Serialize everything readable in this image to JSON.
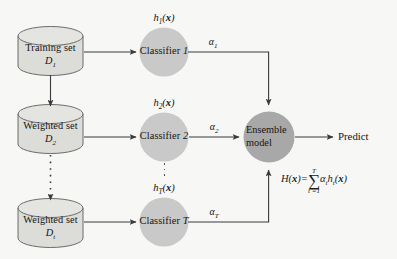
{
  "diagram": {
    "background_color": "#f7f7f6",
    "cylinder_fill": "#dcdcd8",
    "cylinder_stroke": "#5c5c5c",
    "classifier_fill": "#c9c9c9",
    "ensemble_fill": "#a8a8a8",
    "line_color": "#3a3a3a"
  },
  "datasets": [
    {
      "name": "training-set",
      "label": "Training set",
      "symbol_base": "D",
      "symbol_sub": "1"
    },
    {
      "name": "weighted-set-2",
      "label": "Weighted set",
      "symbol_base": "D",
      "symbol_sub": "2"
    },
    {
      "name": "weighted-set-t",
      "label": "Weighted set",
      "symbol_base": "D",
      "symbol_sub": "t"
    }
  ],
  "classifiers": [
    {
      "name": "classifier-1",
      "label": "Classifier",
      "index": "1",
      "h_base": "h",
      "h_sub": "1",
      "h_arg": "(x)",
      "alpha_base": "α",
      "alpha_sub": "1"
    },
    {
      "name": "classifier-2",
      "label": "Classifier",
      "index": "2",
      "h_base": "h",
      "h_sub": "2",
      "h_arg": "(x)",
      "alpha_base": "α",
      "alpha_sub": "2"
    },
    {
      "name": "classifier-t",
      "label": "Classifier",
      "index": "T",
      "h_base": "h",
      "h_sub": "T",
      "h_arg": "(x)",
      "alpha_base": "α",
      "alpha_sub": "T"
    }
  ],
  "ensemble": {
    "line1": "Ensemble",
    "line2": "model"
  },
  "output": {
    "label": "Predict"
  },
  "formula": {
    "lhs": "H(x)=",
    "sum_glyph": "∑",
    "sum_upper": "T",
    "sum_lower": "t =1",
    "term_alpha": "α",
    "term_alpha_sub": "t",
    "term_h": "h",
    "term_h_sub": "t",
    "term_arg": "(x)"
  }
}
